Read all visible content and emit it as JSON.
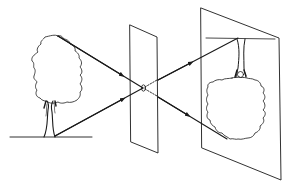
{
  "diagram": {
    "object": "tree",
    "barrier": "plane-with-pinhole",
    "image_plane": "inverted-tree-image",
    "colors": {
      "stroke": "#1a1a1a",
      "background": "#ffffff"
    }
  }
}
